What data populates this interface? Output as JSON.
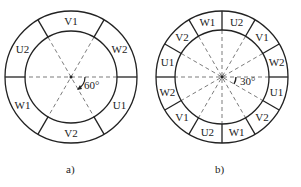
{
  "figures": [
    {
      "id": "a",
      "caption": "a)",
      "center": [
        71,
        77
      ],
      "outer_r": 66,
      "inner_r": 46,
      "sector_count": 6,
      "divider_start_deg": 0,
      "labels": [
        "W2",
        "V1",
        "U2",
        "W1",
        "V2",
        "U1"
      ],
      "label_angles_deg": [
        30,
        90,
        150,
        210,
        270,
        330
      ],
      "dashed_angles_deg": [
        0,
        60,
        120
      ],
      "angle_annotation": "60°"
    },
    {
      "id": "b",
      "caption": "b)",
      "center": [
        222,
        77
      ],
      "outer_r": 66,
      "inner_r": 47,
      "sector_count": 12,
      "divider_start_deg": 0,
      "labels": [
        "W2",
        "V1",
        "U2",
        "W1",
        "V2",
        "U1",
        "W2",
        "V1",
        "U2",
        "W1",
        "V2",
        "U1"
      ],
      "label_angles_deg": [
        15,
        45,
        75,
        105,
        135,
        165,
        195,
        225,
        255,
        285,
        315,
        345
      ],
      "dashed_angles_deg": [
        0,
        30,
        60,
        90,
        120,
        150
      ],
      "angle_annotation": "30°"
    }
  ],
  "colors": {
    "line": "#222222",
    "background": "#ffffff"
  }
}
